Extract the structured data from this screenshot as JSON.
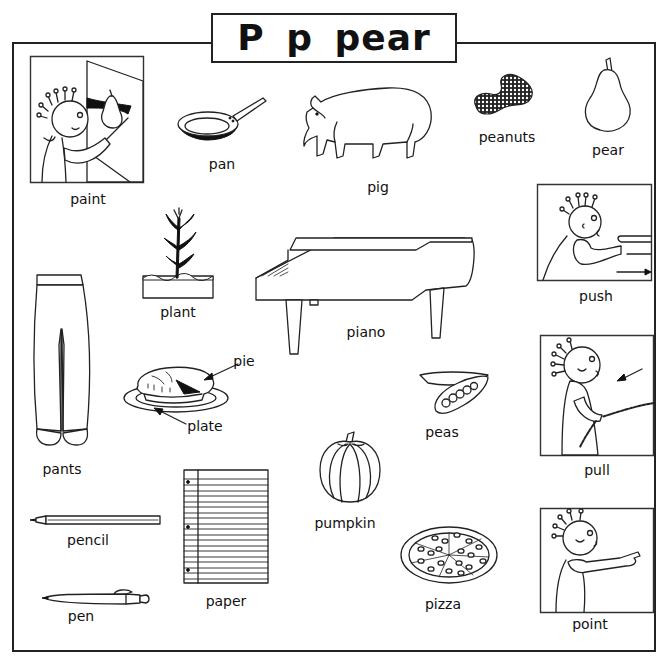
{
  "worksheet": {
    "title": "P p  pear",
    "letter_upper": "P",
    "letter_lower": "p",
    "keyword": "pear"
  },
  "items": {
    "paint": "paint",
    "pan": "pan",
    "pig": "pig",
    "peanuts": "peanuts",
    "pear": "pear",
    "plant": "plant",
    "piano": "piano",
    "push": "push",
    "pants": "pants",
    "pie": "pie",
    "plate": "plate",
    "peas": "peas",
    "pull": "pull",
    "pumpkin": "pumpkin",
    "pencil": "pencil",
    "paper": "paper",
    "pen": "pen",
    "pizza": "pizza",
    "point": "point"
  },
  "icons": {
    "paint": "person-painting-pear-icon",
    "pan": "frying-pan-icon",
    "pig": "pig-icon",
    "peanuts": "peanuts-icon",
    "pear": "pear-icon",
    "plant": "plant-icon",
    "piano": "grand-piano-icon",
    "push": "person-pushing-icon",
    "pants": "pants-icon",
    "pie": "pie-on-plate-icon",
    "peas": "pea-pod-icon",
    "pull": "person-pulling-rope-icon",
    "pumpkin": "pumpkin-icon",
    "pencil": "pencil-icon",
    "paper": "lined-paper-icon",
    "pen": "pen-icon",
    "pizza": "pizza-icon",
    "point": "person-pointing-icon"
  },
  "colors": {
    "ink": "#111111",
    "background": "#ffffff"
  }
}
